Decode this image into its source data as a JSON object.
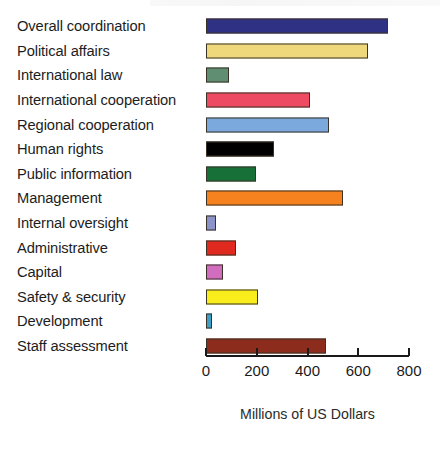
{
  "chart_data": {
    "type": "bar",
    "orientation": "horizontal",
    "title": "",
    "xlabel": "Millions of US Dollars",
    "ylabel": "",
    "xlim": [
      0,
      800
    ],
    "xticks": [
      0,
      200,
      400,
      600,
      800
    ],
    "xticklabels": [
      "0",
      "200",
      "400",
      "600",
      "800"
    ],
    "grid": false,
    "legend": false,
    "categories": [
      "Overall coordination",
      "Political affairs",
      "International law",
      "International cooperation",
      "Regional cooperation",
      "Human rights",
      "Public information",
      "Management",
      "Internal oversight",
      "Administrative",
      "Capital",
      "Safety & security",
      "Development",
      "Staff assessment"
    ],
    "values": [
      718,
      637,
      92,
      408,
      486,
      267,
      196,
      541,
      38,
      117,
      67,
      204,
      25,
      472
    ],
    "colors": [
      "#2f3184",
      "#efd87c",
      "#5f8e72",
      "#ee4a63",
      "#7ba8dd",
      "#000000",
      "#177038",
      "#f5821f",
      "#8b93c8",
      "#e02a1f",
      "#d06dbe",
      "#f9ed1c",
      "#3f9fc4",
      "#8c2c1c"
    ],
    "bar_edge_color": "#3a3226"
  },
  "axis_title": "Millions of US Dollars"
}
